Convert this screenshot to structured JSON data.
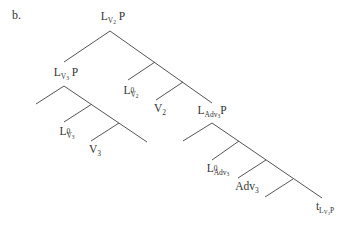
{
  "diagram": {
    "marker": "b.",
    "line_color": "#555555",
    "nodes": {
      "root": {
        "base": "L",
        "sub": "V",
        "subsub": "2",
        "after": " P"
      },
      "lv3p": {
        "base": "L",
        "sub": "V",
        "subsub": "3",
        "after": " P"
      },
      "l0v2": {
        "base": "L",
        "sup": "0",
        "sub": "V",
        "subsub": "2"
      },
      "v2": {
        "base": "V",
        "sub": "2"
      },
      "l0v3": {
        "base": "L",
        "sup": "0",
        "sub": "V",
        "subsub": "3"
      },
      "v3": {
        "base": "V",
        "sub": "3"
      },
      "ladvp": {
        "base": "L",
        "sub": "Adv",
        "subsub": "3",
        "after": "P"
      },
      "l0adv": {
        "base": "L",
        "sup": "0",
        "sub": "Adv",
        "subsub": "3"
      },
      "adv3": {
        "base": "Adv",
        "sub": "3"
      },
      "trace": {
        "base": "t",
        "sub": "L",
        "subsub": "V",
        "subsubsub": "3",
        "after": "P"
      }
    },
    "edges": [
      [
        110,
        31,
        64,
        62
      ],
      [
        110,
        31,
        212,
        103
      ],
      [
        155,
        62,
        128,
        80
      ],
      [
        183,
        82,
        156,
        100
      ],
      [
        64,
        86,
        36,
        104
      ],
      [
        64,
        86,
        147,
        142
      ],
      [
        92,
        104,
        64,
        122
      ],
      [
        119,
        123,
        91,
        141
      ],
      [
        212,
        123,
        183,
        141
      ],
      [
        212,
        123,
        322,
        198
      ],
      [
        239,
        141,
        212,
        160
      ],
      [
        266,
        160,
        238,
        178
      ],
      [
        293,
        179,
        265,
        197
      ]
    ]
  }
}
